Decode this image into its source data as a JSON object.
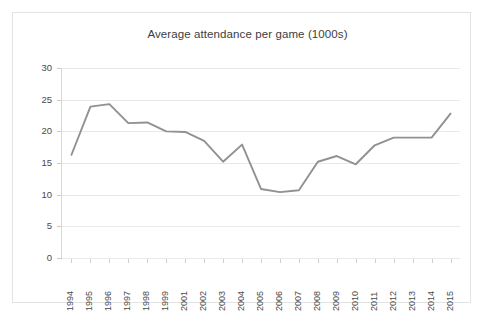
{
  "figure": {
    "background_color": "#ffffff",
    "border_color": "#e3e3e3"
  },
  "chart_data": {
    "type": "line",
    "title": "Average attendance per game (1000s)",
    "xlabel": "",
    "ylabel": "",
    "categories": [
      "1994",
      "1995",
      "1996",
      "1997",
      "1998",
      "1999",
      "2001",
      "2002",
      "2003",
      "2004",
      "2005",
      "2006",
      "2007",
      "2008",
      "2009",
      "2010",
      "2011",
      "2012",
      "2013",
      "2014",
      "2015"
    ],
    "values": [
      16.3,
      23.9,
      24.3,
      21.3,
      21.4,
      20.0,
      19.9,
      18.5,
      15.2,
      17.9,
      10.9,
      10.4,
      10.7,
      15.2,
      16.1,
      14.8,
      17.8,
      19.0,
      19.0,
      19.0,
      22.8
    ],
    "ylim": [
      0,
      30
    ],
    "yticks": [
      0,
      5,
      10,
      15,
      20,
      25,
      30
    ],
    "ytick_labels": [
      "0",
      "5",
      "10",
      "15",
      "20",
      "25",
      "30"
    ],
    "grid": "horizontal",
    "legend": "none",
    "series_color": "#919191",
    "gridline_color": "#e9e9e9",
    "axis_color": "#c9c9c9",
    "tick_label_color": "#4a4a4a",
    "title_color": "#3d3d3d"
  }
}
